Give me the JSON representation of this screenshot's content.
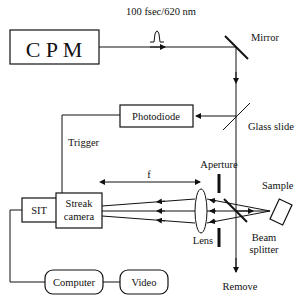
{
  "diagram": {
    "source": {
      "label": "C P M"
    },
    "pulse": {
      "label": "100 fsec/620 nm"
    },
    "mirror": {
      "label": "Mirror"
    },
    "glass_slide": {
      "label": "Glass slide"
    },
    "photodiode": {
      "label": "Photodiode"
    },
    "trigger": {
      "label": "Trigger"
    },
    "aperture": {
      "label": "Aperture"
    },
    "sample": {
      "label": "Sample"
    },
    "focal_length": {
      "label": "f"
    },
    "sit": {
      "label": "SIT"
    },
    "streak_camera": {
      "line1": "Streak",
      "line2": "camera"
    },
    "lens": {
      "label": "Lens"
    },
    "beam_splitter": {
      "line1": "Beam",
      "line2": "splitter"
    },
    "computer": {
      "label": "Computer"
    },
    "video": {
      "label": "Video"
    },
    "remove": {
      "label": "Remove"
    }
  }
}
